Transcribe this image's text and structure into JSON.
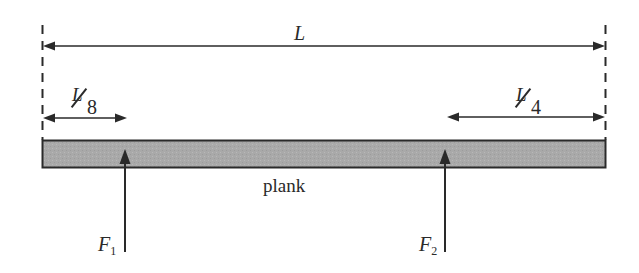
{
  "diagram": {
    "type": "plank-with-two-supports",
    "labels": {
      "total_length": "L",
      "left_offset_num": "L",
      "left_offset_den": "8",
      "right_offset_num": "L",
      "right_offset_den": "4",
      "plank": "plank",
      "force1_main": "F",
      "force1_sub": "1",
      "force2_main": "F",
      "force2_sub": "2"
    },
    "dimensions": {
      "total": "L",
      "left_support_distance_from_left_end": "L/8",
      "right_support_distance_from_right_end": "L/4"
    },
    "forces": [
      {
        "name": "F1",
        "direction": "up",
        "position": "L/8 from left end"
      },
      {
        "name": "F2",
        "direction": "up",
        "position": "L/4 from right end"
      }
    ],
    "colors": {
      "plank_fill": "#a9a9a9",
      "stroke": "#2a2a2a",
      "background": "#ffffff"
    }
  }
}
